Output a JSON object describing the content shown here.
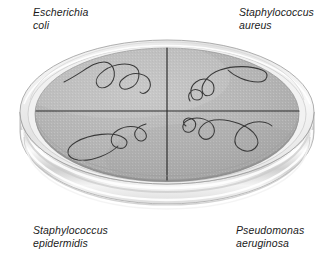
{
  "figure": {
    "name": "quadrant-streak-plate-diagram",
    "colors": {
      "background": "#ffffff",
      "agar": "#b4b4b4",
      "agar_light": "#c4c4c4",
      "agar_shadow": "#a2a2a2",
      "dish_wall": "#d8d8d8",
      "dish_highlight": "#ffffff",
      "dish_outline": "#8e8e8e",
      "divider_line": "#2b2b2b",
      "streak_line": "#3a3a3a",
      "label_text": "#1b1b1b"
    }
  },
  "labels": {
    "top_left": "Escherichia\ncoli",
    "top_right": "Staphylococcus\naureus",
    "bottom_left": "Staphylococcus\nepidermidis",
    "bottom_right": "Pseudomonas\naeruginosa"
  },
  "quadrants": [
    {
      "id": "top-left",
      "organism": "Escherichia coli",
      "streak": "serpentine"
    },
    {
      "id": "top-right",
      "organism": "Staphylococcus aureus",
      "streak": "serpentine"
    },
    {
      "id": "bottom-left",
      "organism": "Staphylococcus epidermidis",
      "streak": "serpentine"
    },
    {
      "id": "bottom-right",
      "organism": "Pseudomonas aeruginosa",
      "streak": "serpentine"
    }
  ]
}
